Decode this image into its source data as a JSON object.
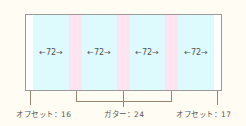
{
  "diagram": {
    "title": "",
    "colors": {
      "background": "#fffdf3",
      "frame_border": "#9a9a9a",
      "column": "#ddfafd",
      "gutter": "#fde4ef",
      "leader_line": "#9a8470"
    },
    "columns": [
      {
        "label": "←72→",
        "width": 72
      },
      {
        "label": "←72→",
        "width": 72
      },
      {
        "label": "←72→",
        "width": 72
      },
      {
        "label": "←72→",
        "width": 72
      }
    ],
    "annotations": {
      "left_offset": "オフセット：16",
      "gutter": "ガター：24",
      "right_offset": "オフセット：17"
    }
  }
}
